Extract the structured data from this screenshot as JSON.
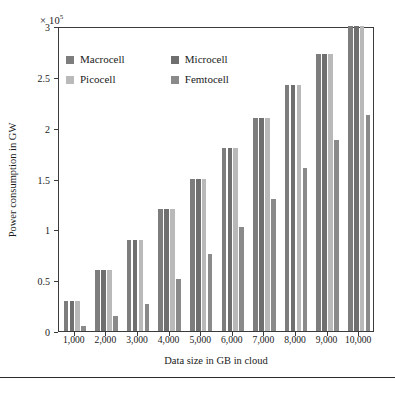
{
  "axes": {
    "exponent_prefix": "× 10",
    "exponent_power": "5",
    "ylabel": "Power consumption in GW",
    "xlabel": "Data size in GB in cloud",
    "yticks": [
      "0",
      "0.5",
      "1",
      "1.5",
      "2",
      "2.5",
      "3"
    ]
  },
  "legend": {
    "items": [
      {
        "label": "Macrocell",
        "color": "#7d7d7d"
      },
      {
        "label": "Microcell",
        "color": "#6f6f6f"
      },
      {
        "label": "Picocell",
        "color": "#b9b9b9"
      },
      {
        "label": "Femtocell",
        "color": "#8a8a8a"
      }
    ]
  },
  "chart_data": {
    "type": "bar",
    "title": "",
    "xlabel": "Data size in GB in cloud",
    "ylabel": "Power consumption in GW",
    "y_scale_note": "× 10^5",
    "ylim": [
      0,
      3
    ],
    "ytick_values": [
      0,
      0.5,
      1,
      1.5,
      2,
      2.5,
      3
    ],
    "grid": false,
    "legend_position": "upper-left-inside",
    "categories": [
      "1,000",
      "2,000",
      "3,000",
      "4,000",
      "5,000",
      "6,000",
      "7,000",
      "8,000",
      "9,000",
      "10,000"
    ],
    "series": [
      {
        "name": "Macrocell",
        "color": "#7d7d7d",
        "values": [
          0.3,
          0.6,
          0.9,
          1.2,
          1.5,
          1.8,
          2.1,
          2.42,
          2.72,
          3.0
        ]
      },
      {
        "name": "Microcell",
        "color": "#6f6f6f",
        "values": [
          0.3,
          0.6,
          0.9,
          1.2,
          1.5,
          1.8,
          2.1,
          2.42,
          2.72,
          3.0
        ]
      },
      {
        "name": "Picocell",
        "color": "#b9b9b9",
        "values": [
          0.3,
          0.6,
          0.9,
          1.2,
          1.5,
          1.8,
          2.1,
          2.42,
          2.72,
          3.0
        ]
      },
      {
        "name": "Femtocell",
        "color": "#8a8a8a",
        "values": [
          0.05,
          0.15,
          0.27,
          0.51,
          0.76,
          1.02,
          1.3,
          1.6,
          1.88,
          2.12
        ]
      }
    ]
  }
}
